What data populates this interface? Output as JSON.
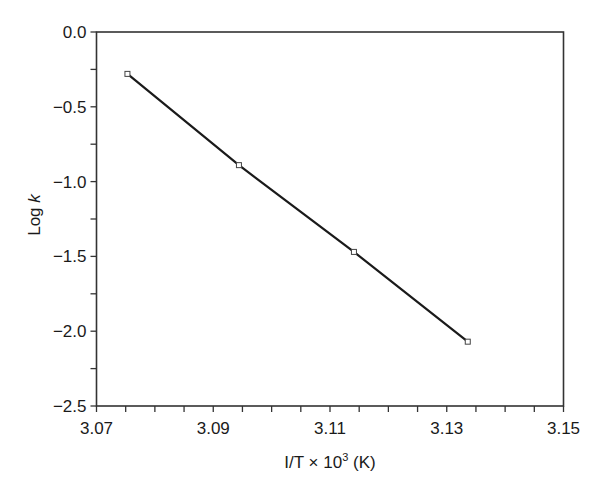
{
  "chart_data": {
    "type": "line",
    "title": "",
    "xlabel": "I/T × 10³ (K)",
    "xlabel_parts": {
      "main": "I/T × 10",
      "sup": "3",
      "unit": " (K)"
    },
    "ylabel": "Log k",
    "ylabel_parts": {
      "main": "Log ",
      "italic": "k"
    },
    "xlim": [
      3.07,
      3.15
    ],
    "ylim": [
      -2.5,
      0.0
    ],
    "x_ticks": [
      3.07,
      3.09,
      3.11,
      3.13,
      3.15
    ],
    "x_tick_labels": [
      "3.07",
      "3.09",
      "3.11",
      "3.13",
      "3.15"
    ],
    "x_minor_step": 0.005,
    "y_ticks": [
      0.0,
      -0.5,
      -1.0,
      -1.5,
      -2.0,
      -2.5
    ],
    "y_tick_labels": [
      "0.0",
      "−0.5",
      "−1.0",
      "−1.5",
      "−2.0",
      "−2.5"
    ],
    "y_minor_step": 0.25,
    "grid": false,
    "legend": null,
    "series": [
      {
        "name": "Log k vs 1/T",
        "marker": "square",
        "line": "solid",
        "color": "#1a1a1a",
        "x": [
          3.0753,
          3.0944,
          3.1141,
          3.1336
        ],
        "y": [
          -0.28,
          -0.89,
          -1.47,
          -2.07
        ]
      }
    ]
  }
}
